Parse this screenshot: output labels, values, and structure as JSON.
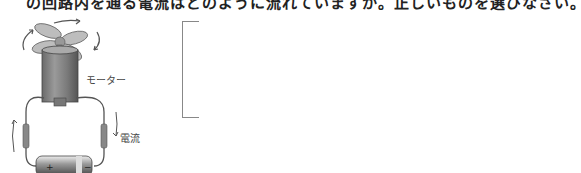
{
  "question": {
    "text": "の回路内を通る電流はどのように流れていますか。正しいものを選びなさい。"
  },
  "diagram": {
    "motor_label": "モーター",
    "current_label": "電流",
    "battery_plus": "+",
    "battery_minus": "−"
  },
  "answer_box": {
    "content": ""
  }
}
